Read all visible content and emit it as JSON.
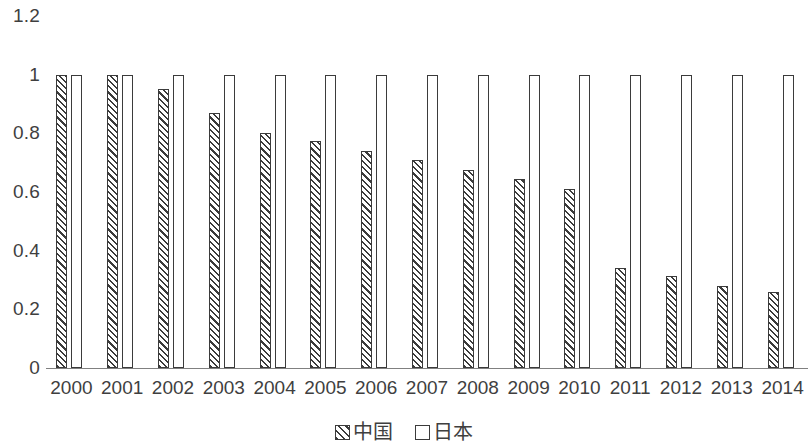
{
  "chart_data": {
    "type": "bar",
    "title": "",
    "subtitle": "",
    "xlabel": "",
    "ylabel": "",
    "categories": [
      "2000",
      "2001",
      "2002",
      "2003",
      "2004",
      "2005",
      "2006",
      "2007",
      "2008",
      "2009",
      "2010",
      "2011",
      "2012",
      "2013",
      "2014"
    ],
    "series": [
      {
        "name": "中国",
        "pattern": "diagonal-hatch",
        "values": [
          1,
          1,
          0.95,
          0.87,
          0.8,
          0.775,
          0.74,
          0.71,
          0.675,
          0.645,
          0.61,
          0.34,
          0.315,
          0.28,
          0.26
        ]
      },
      {
        "name": "日本",
        "pattern": "hollow",
        "values": [
          1,
          1,
          1,
          1,
          1,
          1,
          1,
          1,
          1,
          1,
          1,
          1,
          1,
          1,
          1
        ]
      }
    ],
    "ylim": [
      0,
      1.2
    ],
    "y_ticks": [
      "0",
      "0.2",
      "0.4",
      "0.6",
      "0.8",
      "1",
      "1.2"
    ],
    "y_tick_values": [
      0,
      0.2,
      0.4,
      0.6,
      0.8,
      1,
      1.2
    ],
    "grid": false,
    "legend_position": "bottom",
    "colors": {
      "bar_outline": "#3b3b3b",
      "hatch": "#3b3b3b",
      "fill": "#ffffff",
      "axis_line": "#808080",
      "text": "#3f3f3f"
    }
  },
  "legend": {
    "items": [
      {
        "label": "中国",
        "style": "hatched"
      },
      {
        "label": "日本",
        "style": "hollow"
      }
    ]
  }
}
